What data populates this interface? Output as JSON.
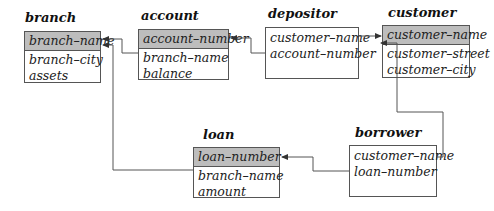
{
  "tables": [
    {
      "id": "branch",
      "title": "branch",
      "primary_key": "branch–name",
      "attributes": [
        "branch–city",
        "assets"
      ]
    },
    {
      "id": "account",
      "title": "account",
      "primary_key": "account–number",
      "attributes": [
        "branch–name",
        "balance"
      ]
    },
    {
      "id": "depositor",
      "title": "depositor",
      "primary_key": null,
      "attributes": [
        "customer–name",
        "account–number"
      ]
    },
    {
      "id": "customer",
      "title": "customer",
      "primary_key": "customer–name",
      "attributes": [
        "customer–street",
        "customer–city"
      ]
    },
    {
      "id": "loan",
      "title": "loan",
      "primary_key": "loan–number",
      "attributes": [
        "branch–name",
        "amount"
      ]
    },
    {
      "id": "borrower",
      "title": "borrower",
      "primary_key": null,
      "attributes": [
        "customer–name",
        "loan–number"
      ]
    }
  ],
  "foreign_keys": [
    {
      "from": "account.branch–name",
      "to": "branch.branch–name"
    },
    {
      "from": "loan.branch–name",
      "to": "branch.branch–name"
    },
    {
      "from": "depositor.account–number",
      "to": "account.account–number"
    },
    {
      "from": "depositor.customer–name",
      "to": "customer.customer–name"
    },
    {
      "from": "borrower.customer–name",
      "to": "customer.customer–name"
    },
    {
      "from": "borrower.loan–number",
      "to": "loan.loan–number"
    }
  ],
  "colors": {
    "primary_key_fill": "#bdbdbd",
    "border": "#555555",
    "line": "#444444"
  }
}
